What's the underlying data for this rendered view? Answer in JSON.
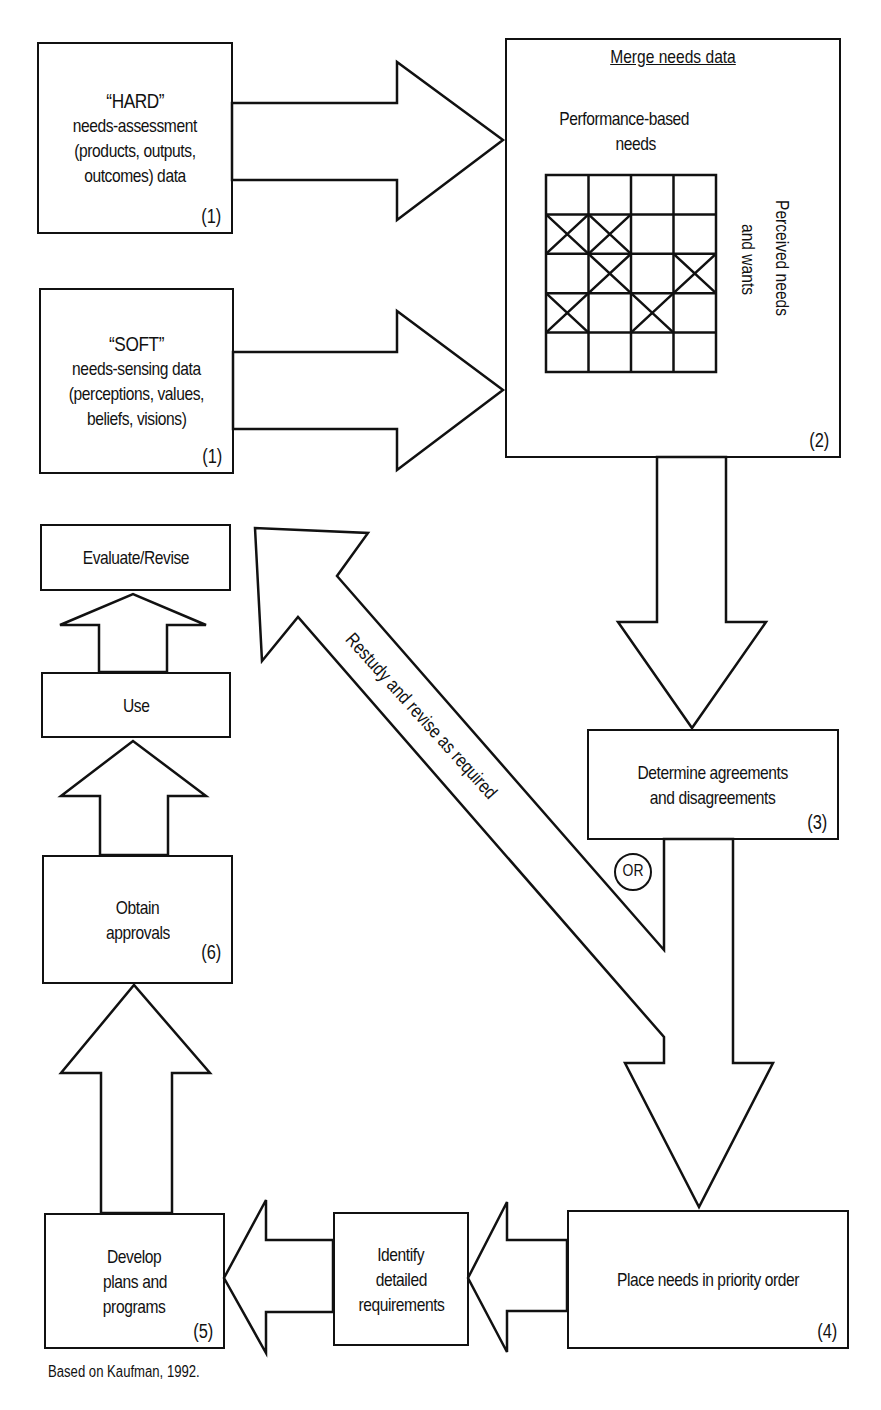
{
  "diagram": {
    "boxes": {
      "hard": {
        "quote": "“HARD”",
        "lines": [
          "needs-assessment",
          "(products, outputs,",
          "outcomes) data"
        ],
        "step": "(1)"
      },
      "soft": {
        "quote": "“SOFT”",
        "lines": [
          "needs-sensing data",
          "(perceptions, values,",
          "beliefs, visions)"
        ],
        "step": "(1)"
      },
      "merge": {
        "title": "Merge needs data",
        "x_axis_label_1": "Performance-based",
        "x_axis_label_2": "needs",
        "y_axis_label_1": "Perceived needs",
        "y_axis_label_2": "and wants",
        "step": "(2)",
        "grid": {
          "rows": 5,
          "cols": 4,
          "crossed_cells": [
            [
              1,
              0
            ],
            [
              1,
              1
            ],
            [
              2,
              1
            ],
            [
              2,
              3
            ],
            [
              3,
              0
            ],
            [
              3,
              2
            ]
          ]
        }
      },
      "determine": {
        "lines": [
          "Determine agreements",
          "and disagreements"
        ],
        "step": "(3)"
      },
      "priority": {
        "label": "Place needs in priority order",
        "step": "(4)"
      },
      "identify": {
        "lines": [
          "Identify",
          "detailed",
          "requirements"
        ]
      },
      "develop": {
        "lines": [
          "Develop",
          "plans and",
          "programs"
        ],
        "step": "(5)"
      },
      "approvals": {
        "lines": [
          "Obtain",
          "approvals"
        ],
        "step": "(6)"
      },
      "use": {
        "label": "Use"
      },
      "evaluate": {
        "label": "Evaluate/Revise"
      }
    },
    "feedback_arrow_label": "Restudy and revise as required",
    "or_label": "OR",
    "caption": "Based on Kaufman, 1992."
  }
}
